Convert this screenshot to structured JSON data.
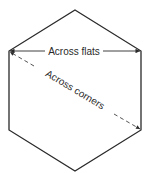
{
  "diagram": {
    "shape": "regular hexagon",
    "labels": {
      "across_flats": "Across flats",
      "across_corners": "Across corners"
    },
    "colors": {
      "stroke": "#2a2a2a",
      "background": "#ffffff"
    }
  }
}
